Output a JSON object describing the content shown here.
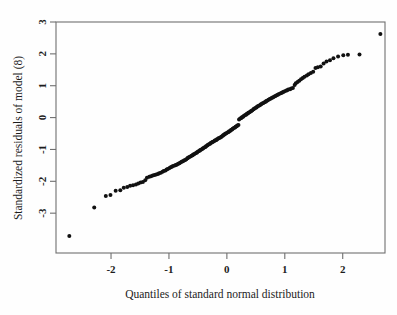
{
  "figure": {
    "title": "",
    "background": "#fefefe",
    "point_color": "#111111",
    "axis_color": "#6f6f6f",
    "text_color": "#1c1c1c"
  },
  "chart_data": {
    "type": "scatter",
    "title": "",
    "subtitle": "",
    "xlabel": "Quantiles of standard normal distribution",
    "ylabel": "Standardized residuals of model (8)",
    "xlim": [
      -2.95,
      2.73
    ],
    "ylim": [
      -4.25,
      3.0
    ],
    "xticks": [
      -2,
      -1,
      0,
      1,
      2
    ],
    "xticklabels": [
      "-2",
      "-1",
      "0",
      "1",
      "2"
    ],
    "yticks": [
      3,
      2,
      1,
      0,
      -1,
      -2,
      -3
    ],
    "yticklabels": [
      "3",
      "2",
      "1",
      "0",
      "-1",
      "-2",
      "-3"
    ],
    "grid": false,
    "legend": null,
    "annotations": [],
    "marker": "filled-circle",
    "marker_size": 2.0,
    "series": [
      {
        "name": "standardized residuals",
        "x": [
          -2.72,
          -2.29,
          -2.09,
          -2.01,
          -1.92,
          -1.84,
          -1.78,
          -1.72,
          -1.67,
          -1.62,
          -1.57,
          -1.53,
          -1.49,
          -1.45,
          -1.41,
          -1.38,
          -1.34,
          -1.31,
          -1.28,
          -1.25,
          -1.22,
          -1.19,
          -1.17,
          -1.14,
          -1.11,
          -1.09,
          -1.06,
          -1.04,
          -1.02,
          -0.99,
          -0.97,
          -0.95,
          -0.93,
          -0.9,
          -0.88,
          -0.86,
          -0.84,
          -0.82,
          -0.8,
          -0.78,
          -0.76,
          -0.74,
          -0.72,
          -0.7,
          -0.68,
          -0.67,
          -0.65,
          -0.63,
          -0.61,
          -0.59,
          -0.58,
          -0.56,
          -0.54,
          -0.52,
          -0.51,
          -0.49,
          -0.47,
          -0.46,
          -0.44,
          -0.42,
          -0.41,
          -0.39,
          -0.37,
          -0.36,
          -0.34,
          -0.33,
          -0.31,
          -0.29,
          -0.28,
          -0.26,
          -0.25,
          -0.23,
          -0.21,
          -0.2,
          -0.18,
          -0.17,
          -0.15,
          -0.14,
          -0.12,
          -0.1,
          -0.09,
          -0.07,
          -0.06,
          -0.04,
          -0.03,
          -0.01,
          0.01,
          0.03,
          0.04,
          0.06,
          0.07,
          0.09,
          0.1,
          0.12,
          0.14,
          0.15,
          0.17,
          0.18,
          0.2,
          0.21,
          0.23,
          0.25,
          0.26,
          0.28,
          0.29,
          0.31,
          0.33,
          0.34,
          0.36,
          0.37,
          0.39,
          0.41,
          0.42,
          0.44,
          0.46,
          0.47,
          0.49,
          0.51,
          0.52,
          0.54,
          0.56,
          0.58,
          0.59,
          0.61,
          0.63,
          0.65,
          0.67,
          0.68,
          0.7,
          0.72,
          0.74,
          0.76,
          0.78,
          0.8,
          0.82,
          0.84,
          0.86,
          0.88,
          0.9,
          0.93,
          0.95,
          0.97,
          0.99,
          1.02,
          1.04,
          1.06,
          1.09,
          1.11,
          1.14,
          1.17,
          1.19,
          1.22,
          1.25,
          1.28,
          1.31,
          1.34,
          1.38,
          1.41,
          1.45,
          1.49,
          1.53,
          1.57,
          1.62,
          1.67,
          1.72,
          1.78,
          1.84,
          1.92,
          2.01,
          2.09,
          2.29,
          2.65
        ],
        "y": [
          -3.72,
          -2.82,
          -2.46,
          -2.43,
          -2.3,
          -2.28,
          -2.2,
          -2.18,
          -2.14,
          -2.12,
          -2.1,
          -2.07,
          -2.04,
          -2.02,
          -1.97,
          -1.89,
          -1.86,
          -1.84,
          -1.82,
          -1.8,
          -1.79,
          -1.77,
          -1.75,
          -1.73,
          -1.7,
          -1.68,
          -1.66,
          -1.63,
          -1.61,
          -1.58,
          -1.56,
          -1.54,
          -1.52,
          -1.5,
          -1.49,
          -1.47,
          -1.45,
          -1.43,
          -1.41,
          -1.39,
          -1.37,
          -1.35,
          -1.33,
          -1.31,
          -1.28,
          -1.26,
          -1.24,
          -1.22,
          -1.2,
          -1.18,
          -1.16,
          -1.14,
          -1.12,
          -1.1,
          -1.08,
          -1.06,
          -1.04,
          -1.02,
          -1.0,
          -0.98,
          -0.96,
          -0.94,
          -0.92,
          -0.9,
          -0.88,
          -0.86,
          -0.84,
          -0.82,
          -0.8,
          -0.78,
          -0.77,
          -0.75,
          -0.73,
          -0.71,
          -0.7,
          -0.68,
          -0.66,
          -0.65,
          -0.63,
          -0.61,
          -0.59,
          -0.57,
          -0.55,
          -0.53,
          -0.51,
          -0.49,
          -0.47,
          -0.45,
          -0.43,
          -0.41,
          -0.39,
          -0.37,
          -0.35,
          -0.33,
          -0.31,
          -0.29,
          -0.27,
          -0.25,
          -0.23,
          -0.06,
          -0.03,
          -0.01,
          0.01,
          0.03,
          0.05,
          0.07,
          0.09,
          0.11,
          0.13,
          0.15,
          0.17,
          0.19,
          0.21,
          0.23,
          0.26,
          0.28,
          0.3,
          0.32,
          0.34,
          0.36,
          0.38,
          0.4,
          0.42,
          0.44,
          0.46,
          0.48,
          0.5,
          0.52,
          0.54,
          0.56,
          0.58,
          0.6,
          0.62,
          0.64,
          0.66,
          0.68,
          0.7,
          0.72,
          0.74,
          0.76,
          0.78,
          0.8,
          0.82,
          0.84,
          0.86,
          0.88,
          0.89,
          0.91,
          0.93,
          1.02,
          1.08,
          1.12,
          1.16,
          1.2,
          1.24,
          1.28,
          1.32,
          1.36,
          1.4,
          1.44,
          1.56,
          1.58,
          1.6,
          1.7,
          1.76,
          1.8,
          1.86,
          1.92,
          1.96,
          1.97,
          1.98,
          2.62
        ]
      }
    ]
  }
}
